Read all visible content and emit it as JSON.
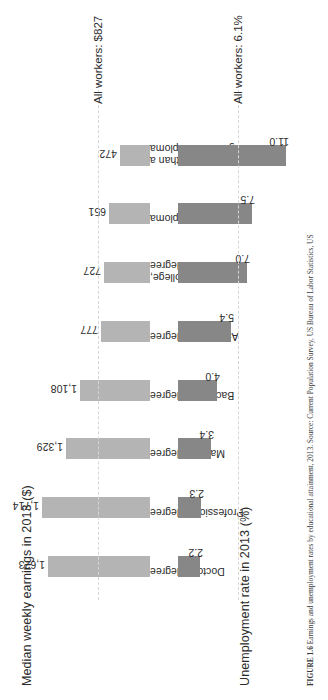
{
  "figure": {
    "caption_label": "FIGURE 1.6",
    "caption_text": "Earnings and unemployment rates by educational attainment, 2013.",
    "caption_source": "Source: Current Population Survey, US Bureau of Labor Statistics, US"
  },
  "panels": {
    "earnings": {
      "title": "Median weekly earnings in 2013 ($)",
      "reference_note": "All workers: $827",
      "reference_value": 827
    },
    "unemployment": {
      "title": "Unemployment rate in 2013 (%)",
      "reference_note": "All workers: 6.1%",
      "reference_value": 6.1
    }
  },
  "categories": [
    {
      "line1": "Doctoral degree",
      "line2": ""
    },
    {
      "line1": "Professional degree",
      "line2": ""
    },
    {
      "line1": "Master's degree",
      "line2": ""
    },
    {
      "line1": "Bachelor's degree",
      "line2": ""
    },
    {
      "line1": "Associate's degree",
      "line2": ""
    },
    {
      "line1": "Some college,",
      "line2": "no degree"
    },
    {
      "line1": "High school diploma",
      "line2": ""
    },
    {
      "line1": "Less than a",
      "line2": "high school diploma"
    }
  ],
  "earnings_labels": [
    "1,623",
    "1,714",
    "1,329",
    "1,108",
    "777",
    "727",
    "651",
    "472"
  ],
  "unemployment_labels": [
    "2.2",
    "2.3",
    "3.4",
    "4.0",
    "5.4",
    "7.0",
    "7.5",
    "11.0"
  ],
  "colors": {
    "earnings_bar": "#b4b4b4",
    "unemployment_bar": "#878787",
    "reference_line": "#d6d6d6",
    "text": "#2b2b2b",
    "background": "#ffffff"
  },
  "chart_data": [
    {
      "type": "bar",
      "title": "Median weekly earnings in 2013 ($)",
      "xlabel": "",
      "ylabel": "Median weekly earnings in 2013 ($)",
      "ylim": [
        0,
        1714
      ],
      "grid": false,
      "legend": "none",
      "orientation": "vertical-up",
      "categories": [
        "Doctoral degree",
        "Professional degree",
        "Master's degree",
        "Bachelor's degree",
        "Associate's degree",
        "Some college, no degree",
        "High school diploma",
        "Less than a high school diploma"
      ],
      "values": [
        1623,
        1714,
        1329,
        1108,
        777,
        727,
        651,
        472
      ],
      "data_labels": [
        "1,623",
        "1,714",
        "1,329",
        "1,108",
        "777",
        "727",
        "651",
        "472"
      ],
      "annotations": [
        {
          "text": "All workers: $827",
          "type": "reference-line",
          "value": 827
        }
      ]
    },
    {
      "type": "bar",
      "title": "Unemployment rate in 2013 (%)",
      "xlabel": "",
      "ylabel": "Unemployment rate in 2013 (%)",
      "ylim": [
        0,
        11.0
      ],
      "grid": false,
      "legend": "none",
      "orientation": "vertical-down",
      "categories": [
        "Doctoral degree",
        "Professional degree",
        "Master's degree",
        "Bachelor's degree",
        "Associate's degree",
        "Some college, no degree",
        "High school diploma",
        "Less than a high school diploma"
      ],
      "values": [
        2.2,
        2.3,
        3.4,
        4.0,
        5.4,
        7.0,
        7.5,
        11.0
      ],
      "data_labels": [
        "2.2",
        "2.3",
        "3.4",
        "4.0",
        "5.4",
        "7.0",
        "7.5",
        "11.0"
      ],
      "annotations": [
        {
          "text": "All workers: 6.1%",
          "type": "reference-line",
          "value": 6.1
        }
      ]
    }
  ]
}
